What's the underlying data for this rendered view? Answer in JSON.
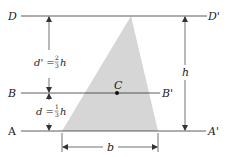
{
  "figure": {
    "lines": {
      "D": {
        "left": "D",
        "right": "D'"
      },
      "B": {
        "left": "B",
        "right": "B'"
      },
      "A": {
        "left": "A",
        "right": "A'"
      }
    },
    "centroid_label": "C",
    "dimensions": {
      "d_prime": {
        "lhs": "d' =",
        "num": "2",
        "den": "3",
        "var": "h"
      },
      "d": {
        "lhs": "d =",
        "num": "1",
        "den": "3",
        "var": "h"
      },
      "height": "h",
      "base": "b"
    },
    "colors": {
      "triangle_fill": "#d6d6d6",
      "line": "#333333"
    }
  }
}
